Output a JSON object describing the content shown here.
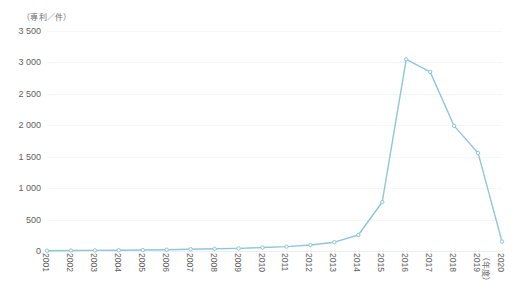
{
  "chart_data": {
    "type": "line",
    "title": "",
    "ylabel": "（専利／件）",
    "xlabel": "（年度）",
    "categories": [
      "2001",
      "2002",
      "2003",
      "2004",
      "2005",
      "2006",
      "2007",
      "2008",
      "2009",
      "2010",
      "2011",
      "2012",
      "2013",
      "2014",
      "2015",
      "2016",
      "2017",
      "2018",
      "2019",
      "2020"
    ],
    "values": [
      5,
      8,
      10,
      12,
      15,
      20,
      28,
      35,
      42,
      55,
      70,
      95,
      140,
      255,
      780,
      3050,
      2850,
      1990,
      1560,
      150
    ],
    "series": [
      {
        "name": "専利件数",
        "color": "#8ec6d8",
        "values": [
          5,
          8,
          10,
          12,
          15,
          20,
          28,
          35,
          42,
          55,
          70,
          95,
          140,
          255,
          780,
          3050,
          2850,
          1990,
          1560,
          150
        ]
      }
    ],
    "ylim": [
      0,
      3500
    ],
    "yticks": [
      0,
      500,
      1000,
      1500,
      2000,
      2500,
      3000,
      3500
    ],
    "ytick_labels": [
      "0",
      "500",
      "1 000",
      "1 500",
      "2 000",
      "2 500",
      "3 000",
      "3 500"
    ],
    "grid": true,
    "legend": "none",
    "marker": "circle",
    "line_color": "#8ec6d8",
    "grid_color": "#f4f6f7",
    "text_color": "#606060"
  }
}
